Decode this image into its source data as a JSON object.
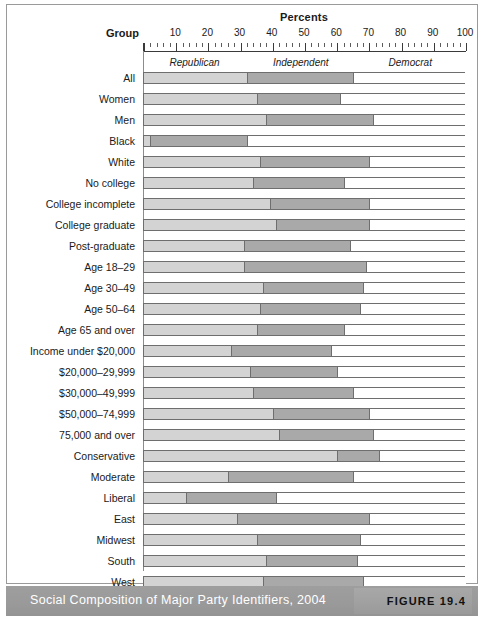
{
  "figure": {
    "caption": "Social Composition of Major Party Identifiers, 2004",
    "figure_label": "FIGURE 19.4"
  },
  "header": {
    "percents_title": "Percents",
    "group_title": "Group"
  },
  "colors": {
    "republican": "#d3d3d3",
    "independent": "#a9a9a9",
    "democrat": "#ffffff",
    "caption_bar": "#9a9a9a",
    "frame": "#9a9a9a"
  },
  "chart_data": {
    "type": "bar",
    "orientation": "horizontal",
    "stacked": true,
    "title": "Social Composition of Major Party Identifiers, 2004",
    "xlabel": "Percents",
    "ylabel": "Group",
    "xlim": [
      0,
      100
    ],
    "xticks": [
      10,
      20,
      30,
      40,
      50,
      60,
      70,
      80,
      90,
      100
    ],
    "xtick_labels": [
      "10",
      "20",
      "30",
      "40",
      "50",
      "60",
      "70",
      "80",
      "90",
      "100"
    ],
    "grid": false,
    "legend_position": "top-inside",
    "legend": [
      "Republican",
      "Independent",
      "Democrat"
    ],
    "categories": [
      "All",
      "Women",
      "Men",
      "Black",
      "White",
      "No college",
      "College incomplete",
      "College graduate",
      "Post-graduate",
      "Age 18–29",
      "Age 30–49",
      "Age 50–64",
      "Age 65 and over",
      "Income under $20,000",
      "$20,000–29,999",
      "$30,000–49,999",
      "$50,000–74,999",
      "75,000 and over",
      "Conservative",
      "Moderate",
      "Liberal",
      "East",
      "Midwest",
      "South",
      "West",
      "National"
    ],
    "series": [
      {
        "name": "Republican",
        "values": [
          32,
          35,
          38,
          2,
          36,
          34,
          39,
          41,
          31,
          31,
          37,
          36,
          35,
          27,
          33,
          34,
          40,
          42,
          60,
          26,
          13,
          29,
          35,
          38,
          37,
          33
        ]
      },
      {
        "name": "Independent",
        "values": [
          33,
          26,
          33,
          30,
          34,
          28,
          31,
          29,
          33,
          38,
          31,
          31,
          27,
          31,
          27,
          31,
          30,
          29,
          13,
          39,
          28,
          41,
          32,
          28,
          31,
          32
        ]
      },
      {
        "name": "Democrat",
        "values": [
          35,
          39,
          29,
          68,
          30,
          38,
          30,
          30,
          36,
          31,
          32,
          33,
          38,
          42,
          40,
          35,
          30,
          29,
          27,
          35,
          59,
          30,
          33,
          34,
          32,
          35
        ]
      }
    ]
  }
}
